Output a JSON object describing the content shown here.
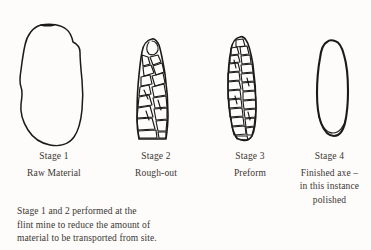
{
  "figure": {
    "ink_color": "#1a1a1a",
    "background_color": "#fdfcfa",
    "text_color": "#3a3632"
  },
  "stages": [
    {
      "number": "Stage 1",
      "name": "Raw Material",
      "shape": "irregular-flint-nodule-outline"
    },
    {
      "number": "Stage 2",
      "name": "Rough-out",
      "shape": "elongated-teardrop-with-flake-scars"
    },
    {
      "number": "Stage 3",
      "name": "Preform",
      "shape": "narrow-blade-with-dense-flake-scars"
    },
    {
      "number": "Stage 4",
      "name": "Finished axe –\nin this instance\npolished",
      "name_line1": "Finished axe –",
      "name_line2": "in this instance",
      "name_line3": "polished",
      "shape": "smooth-polished-axe-outline"
    }
  ],
  "caption": {
    "line1": "Stage 1 and 2 performed at the",
    "line2": "flint mine to reduce the amount of",
    "line3": "material to be transported from site."
  }
}
